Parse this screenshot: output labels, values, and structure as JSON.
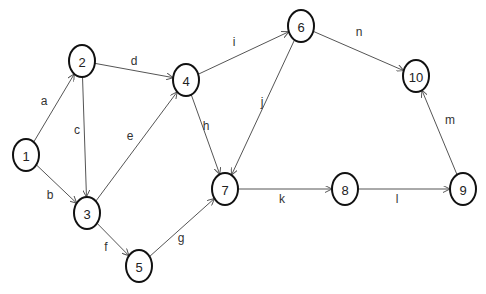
{
  "diagram": {
    "type": "directed-network",
    "nodes": [
      {
        "id": "1",
        "label": "1",
        "x": 26,
        "y": 155
      },
      {
        "id": "2",
        "label": "2",
        "x": 82,
        "y": 61
      },
      {
        "id": "3",
        "label": "3",
        "x": 87,
        "y": 213
      },
      {
        "id": "4",
        "label": "4",
        "x": 186,
        "y": 80
      },
      {
        "id": "5",
        "label": "5",
        "x": 139,
        "y": 266
      },
      {
        "id": "6",
        "label": "6",
        "x": 301,
        "y": 26
      },
      {
        "id": "7",
        "label": "7",
        "x": 225,
        "y": 189
      },
      {
        "id": "8",
        "label": "8",
        "x": 345,
        "y": 189
      },
      {
        "id": "9",
        "label": "9",
        "x": 463,
        "y": 189
      },
      {
        "id": "10",
        "label": "10",
        "x": 416,
        "y": 76
      }
    ],
    "edges": [
      {
        "label": "a",
        "from": "1",
        "to": "2",
        "lx": 44,
        "ly": 101
      },
      {
        "label": "b",
        "from": "1",
        "to": "3",
        "lx": 50,
        "ly": 195
      },
      {
        "label": "c",
        "from": "2",
        "to": "3",
        "lx": 77,
        "ly": 130
      },
      {
        "label": "d",
        "from": "2",
        "to": "4",
        "lx": 134,
        "ly": 61
      },
      {
        "label": "e",
        "from": "3",
        "to": "4",
        "lx": 130,
        "ly": 136
      },
      {
        "label": "f",
        "from": "3",
        "to": "5",
        "lx": 106,
        "ly": 247
      },
      {
        "label": "g",
        "from": "5",
        "to": "7",
        "lx": 181,
        "ly": 238
      },
      {
        "label": "h",
        "from": "4",
        "to": "7",
        "lx": 206,
        "ly": 126
      },
      {
        "label": "i",
        "from": "4",
        "to": "6",
        "lx": 234,
        "ly": 42
      },
      {
        "label": "j",
        "from": "6",
        "to": "7",
        "lx": 262,
        "ly": 102
      },
      {
        "label": "k",
        "from": "7",
        "to": "8",
        "lx": 282,
        "ly": 199
      },
      {
        "label": "l",
        "from": "8",
        "to": "9",
        "lx": 397,
        "ly": 199
      },
      {
        "label": "m",
        "from": "9",
        "to": "10",
        "lx": 450,
        "ly": 120
      },
      {
        "label": "n",
        "from": "6",
        "to": "10",
        "lx": 359,
        "ly": 32
      }
    ]
  }
}
